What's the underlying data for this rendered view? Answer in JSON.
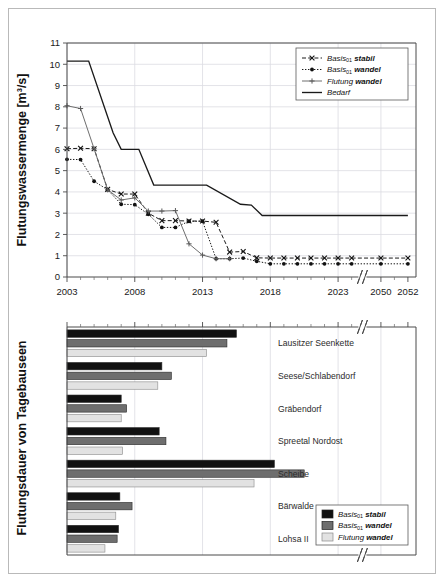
{
  "figure": {
    "background": "#ffffff",
    "frame_color": "#b9b9b9"
  },
  "shared_x_axis": {
    "tick_labels": [
      "2003",
      "2008",
      "2013",
      "2018",
      "2023",
      "2050",
      "2052"
    ],
    "has_axis_break": true,
    "break_between": [
      "2023",
      "2050"
    ]
  },
  "top_chart": {
    "ylabel": "Flutungswassermenge [m³/s]",
    "y_ticks": [
      "0",
      "1",
      "2",
      "3",
      "4",
      "5",
      "6",
      "7",
      "8",
      "9",
      "10",
      "11"
    ],
    "legend": [
      {
        "label_main": "Basis",
        "label_sub": "01",
        "label_tail": "stabil",
        "style": "dashed-x",
        "color": "#1a1a1a"
      },
      {
        "label_main": "Basis",
        "label_sub": "01",
        "label_tail": "wandel",
        "style": "dotted-dot",
        "color": "#1a1a1a"
      },
      {
        "label_main": "Flutung",
        "label_sub": "",
        "label_tail": "wandel",
        "style": "solid-plus",
        "color": "#6e6e6e"
      },
      {
        "label_main": "Bedarf",
        "label_sub": "",
        "label_tail": "",
        "style": "solid",
        "color": "#1a1a1a"
      }
    ]
  },
  "bottom_chart": {
    "ylabel": "Flutungsdauer von Tagebauseen",
    "legend": [
      {
        "label_main": "Basis",
        "label_sub": "01",
        "label_tail": "stabil",
        "fill": "#111111"
      },
      {
        "label_main": "Basis",
        "label_sub": "01",
        "label_tail": "wandel",
        "fill": "#6e6e6e"
      },
      {
        "label_main": "Flutung",
        "label_sub": "",
        "label_tail": "wandel",
        "fill": "#e2e2e2"
      }
    ]
  },
  "chart_data": [
    {
      "type": "line",
      "id": "flutungswassermenge",
      "title": "",
      "xlabel": "",
      "ylabel": "Flutungswassermenge [m³/s]",
      "xlim": [
        2003,
        2052
      ],
      "ylim": [
        0,
        11
      ],
      "grid": true,
      "legend_position": "top-right",
      "x_tick_labels": [
        "2003",
        "2008",
        "2013",
        "2018",
        "2023",
        "2050",
        "2052"
      ],
      "y_tick_labels": [
        "0",
        "1",
        "2",
        "3",
        "4",
        "5",
        "6",
        "7",
        "8",
        "9",
        "10",
        "11"
      ],
      "axis_break": {
        "after": 2024.5,
        "before": 2049
      },
      "series": [
        {
          "name": "Basis01 stabil",
          "style": "dashed",
          "marker": "x",
          "color": "#1a1a1a",
          "x": [
            2003,
            2004,
            2005,
            2006,
            2007,
            2008,
            2009,
            2010,
            2011,
            2012,
            2013,
            2014,
            2015,
            2016,
            2017,
            2018,
            2019,
            2020,
            2021,
            2022,
            2023,
            2024,
            2050,
            2052
          ],
          "y": [
            6.03,
            6.05,
            6.03,
            4.12,
            3.9,
            3.9,
            3.0,
            2.65,
            2.65,
            2.63,
            2.63,
            2.57,
            1.17,
            1.2,
            0.9,
            0.89,
            0.89,
            0.89,
            0.89,
            0.89,
            0.89,
            0.89,
            0.89,
            0.89
          ]
        },
        {
          "name": "Basis01 wandel",
          "style": "dotted",
          "marker": "dot",
          "color": "#1a1a1a",
          "x": [
            2003,
            2004,
            2005,
            2006,
            2007,
            2008,
            2009,
            2010,
            2011,
            2012,
            2013,
            2014,
            2015,
            2016,
            2017,
            2018,
            2019,
            2020,
            2021,
            2022,
            2023,
            2024,
            2050,
            2052
          ],
          "y": [
            5.53,
            5.52,
            4.5,
            4.1,
            3.42,
            3.4,
            2.95,
            2.33,
            2.33,
            2.62,
            2.62,
            0.86,
            0.86,
            0.89,
            0.74,
            0.62,
            0.62,
            0.62,
            0.62,
            0.62,
            0.62,
            0.62,
            0.62,
            0.62
          ]
        },
        {
          "name": "Flutung wandel",
          "style": "solid",
          "marker": "plus",
          "color": "#6e6e6e",
          "x": [
            2003,
            2004,
            2005,
            2006,
            2007,
            2008,
            2009,
            2010,
            2011,
            2012,
            2013,
            2014,
            2015
          ],
          "y": [
            8.05,
            7.92,
            6.03,
            4.1,
            3.62,
            3.72,
            3.1,
            3.1,
            3.12,
            1.56,
            1.03,
            0.86,
            0.86
          ]
        },
        {
          "name": "Bedarf",
          "style": "solid-thick",
          "marker": "none",
          "color": "#1a1a1a",
          "x": [
            2003,
            2004.6,
            2006.4,
            2007.0,
            2008.3,
            2009.4,
            2010.2,
            2013.3,
            2015.8,
            2016.6,
            2017.4,
            2052
          ],
          "y": [
            10.15,
            10.15,
            6.78,
            6.0,
            6.0,
            4.32,
            4.32,
            4.32,
            3.42,
            3.38,
            2.89,
            2.89
          ]
        }
      ]
    },
    {
      "type": "bar",
      "orientation": "horizontal",
      "id": "flutungsdauer",
      "title": "",
      "ylabel": "Flutungsdauer von Tagebauseen",
      "xlabel": "",
      "xlim": [
        2003,
        2052
      ],
      "grid": true,
      "legend_position": "bottom-right",
      "categories": [
        "Lausitzer Seenkette",
        "Seese/Schlabendorf",
        "Gräbendorf",
        "Spreetal Nordost",
        "Scheibe",
        "Bärwalde",
        "Lohsa II"
      ],
      "series": [
        {
          "name": "Basis01 stabil",
          "fill": "#111111",
          "end_year": [
            2015.5,
            2010.0,
            2007.0,
            2009.8,
            2018.3,
            2006.9,
            2006.8
          ]
        },
        {
          "name": "Basis01 wandel",
          "fill": "#6e6e6e",
          "end_year": [
            2014.8,
            2010.7,
            2007.4,
            2010.3,
            2020.5,
            2007.8,
            2006.7
          ]
        },
        {
          "name": "Flutung wandel",
          "fill": "#e2e2e2",
          "end_year": [
            2013.3,
            2009.7,
            2007.0,
            2007.1,
            2016.8,
            2006.6,
            2005.8
          ]
        }
      ],
      "bar_start_year": 2003
    }
  ]
}
